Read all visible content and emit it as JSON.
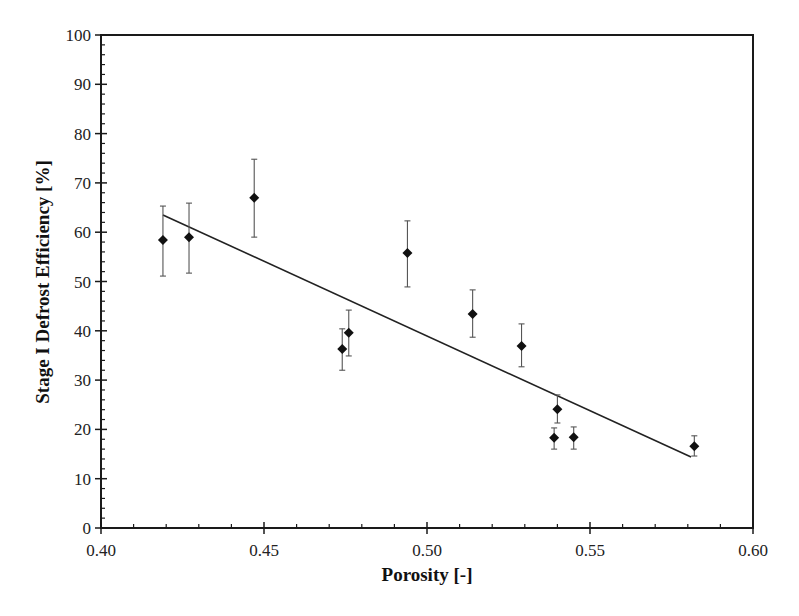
{
  "chart_data": {
    "type": "scatter",
    "title": "",
    "xlabel": "Porosity [-]",
    "ylabel": "Stage I Defrost Efficiency [%]",
    "xlim": [
      0.4,
      0.6
    ],
    "ylim": [
      0,
      100
    ],
    "x_ticks": [
      "0.40",
      "0.45",
      "0.50",
      "0.55",
      "0.60"
    ],
    "y_ticks": [
      "0",
      "10",
      "20",
      "30",
      "40",
      "50",
      "60",
      "70",
      "80",
      "90",
      "100"
    ],
    "x_minor_step": 0.01,
    "y_minor_step": 2,
    "grid": false,
    "legend": null,
    "marker": "diamond",
    "series": [
      {
        "name": "Measured",
        "points": [
          {
            "x": 0.419,
            "y": 58.4,
            "err_low": 51.1,
            "err_high": 65.3
          },
          {
            "x": 0.427,
            "y": 59.0,
            "err_low": 51.7,
            "err_high": 65.9
          },
          {
            "x": 0.447,
            "y": 67.0,
            "err_low": 59.0,
            "err_high": 74.8
          },
          {
            "x": 0.474,
            "y": 36.3,
            "err_low": 32.0,
            "err_high": 40.4
          },
          {
            "x": 0.476,
            "y": 39.6,
            "err_low": 34.9,
            "err_high": 44.2
          },
          {
            "x": 0.494,
            "y": 55.8,
            "err_low": 48.9,
            "err_high": 62.3
          },
          {
            "x": 0.514,
            "y": 43.4,
            "err_low": 38.7,
            "err_high": 48.3
          },
          {
            "x": 0.529,
            "y": 36.9,
            "err_low": 32.7,
            "err_high": 41.4
          },
          {
            "x": 0.54,
            "y": 24.1,
            "err_low": 21.3,
            "err_high": 27.0
          },
          {
            "x": 0.539,
            "y": 18.3,
            "err_low": 16.0,
            "err_high": 20.3
          },
          {
            "x": 0.545,
            "y": 18.4,
            "err_low": 16.0,
            "err_high": 20.5
          },
          {
            "x": 0.582,
            "y": 16.6,
            "err_low": 14.6,
            "err_high": 18.7
          }
        ]
      }
    ],
    "trendline": {
      "type": "linear",
      "x": [
        0.419,
        0.581
      ],
      "y": [
        63.5,
        14.4
      ]
    }
  },
  "colors": {
    "axis": "#1a1a1a",
    "marker": "#111111",
    "errorbar": "#555555",
    "trendline": "#222222"
  }
}
